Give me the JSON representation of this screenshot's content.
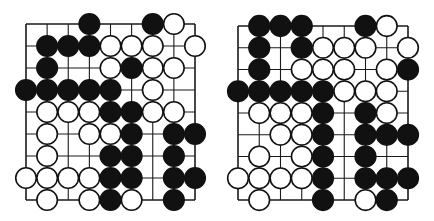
{
  "diagram": {
    "type": "go-board-positions",
    "board_size": 9,
    "colors": {
      "black": "#111111",
      "white": "#ffffff",
      "line": "#1a1a1a",
      "background": "#ffffff"
    },
    "legend": {
      "B": "black-stone",
      "W": "white-stone",
      ".": "empty"
    },
    "boards": [
      {
        "name": "left",
        "grid": {
          "x0": 26,
          "y0": 24,
          "x1": 195,
          "y1": 200
        },
        "rows": [
          "...B..BW.",
          ".BBBWWW.W",
          ".B..WBWW.",
          "BBBBB.W..",
          ".WWWBBWW.",
          ".W.WWB.BB",
          ".W..BB.B.",
          "WWWWBB.BB",
          ".W.WBW.B."
        ]
      },
      {
        "name": "right",
        "grid": {
          "x0": 21,
          "y0": 26,
          "x1": 191,
          "y1": 200
        },
        "rows": [
          ".BBB..BW.",
          ".B.BWWW.W",
          ".B.WWW.WB",
          "BBBBBWWW.",
          ".WWWB.BW.",
          "..WWB.BBB",
          ".W.WB.B..",
          "WWWWB.BBB",
          ".W..B.WB."
        ]
      }
    ]
  }
}
